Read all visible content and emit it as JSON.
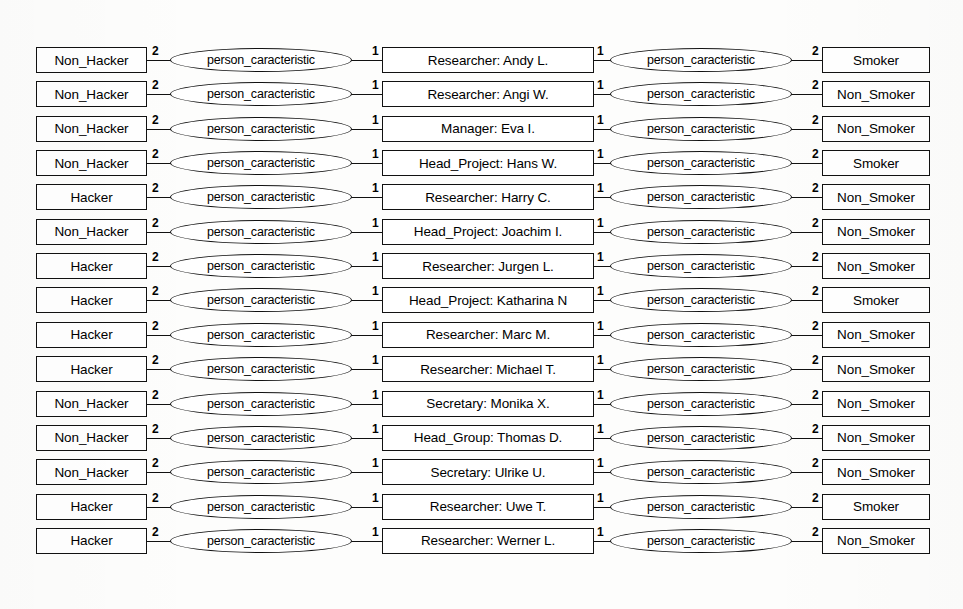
{
  "diagram": {
    "relationship_label": "person_caracteristic",
    "cardinality_left_outer": "2",
    "cardinality_left_inner": "1",
    "cardinality_right_inner": "1",
    "cardinality_right_outer": "2",
    "colors": {
      "stroke": "#111111",
      "background": "#fdfdfc",
      "text": "#000000"
    },
    "columns": {
      "left": "hacker_status",
      "center": "person",
      "right": "smoker_status"
    },
    "rows": [
      {
        "left": "Non_Hacker",
        "rel_left": "person_caracteristic",
        "center": "Researcher: Andy L.",
        "rel_right": "person_caracteristic",
        "right": "Smoker",
        "c1": "2",
        "c2": "1",
        "c3": "1",
        "c4": "2"
      },
      {
        "left": "Non_Hacker",
        "rel_left": "person_caracteristic",
        "center": "Researcher: Angi W.",
        "rel_right": "person_caracteristic",
        "right": "Non_Smoker",
        "c1": "2",
        "c2": "1",
        "c3": "1",
        "c4": "2"
      },
      {
        "left": "Non_Hacker",
        "rel_left": "person_caracteristic",
        "center": "Manager: Eva I.",
        "rel_right": "person_caracteristic",
        "right": "Non_Smoker",
        "c1": "2",
        "c2": "1",
        "c3": "1",
        "c4": "2"
      },
      {
        "left": "Non_Hacker",
        "rel_left": "person_caracteristic",
        "center": "Head_Project: Hans W.",
        "rel_right": "person_caracteristic",
        "right": "Smoker",
        "c1": "2",
        "c2": "1",
        "c3": "1",
        "c4": "2"
      },
      {
        "left": "Hacker",
        "rel_left": "person_caracteristic",
        "center": "Researcher: Harry C.",
        "rel_right": "person_caracteristic",
        "right": "Non_Smoker",
        "c1": "2",
        "c2": "1",
        "c3": "1",
        "c4": "2"
      },
      {
        "left": "Non_Hacker",
        "rel_left": "person_caracteristic",
        "center": "Head_Project: Joachim I.",
        "rel_right": "person_caracteristic",
        "right": "Non_Smoker",
        "c1": "2",
        "c2": "1",
        "c3": "1",
        "c4": "2"
      },
      {
        "left": "Hacker",
        "rel_left": "person_caracteristic",
        "center": "Researcher: Jurgen L.",
        "rel_right": "person_caracteristic",
        "right": "Non_Smoker",
        "c1": "2",
        "c2": "1",
        "c3": "1",
        "c4": "2"
      },
      {
        "left": "Hacker",
        "rel_left": "person_caracteristic",
        "center": "Head_Project: Katharina N",
        "rel_right": "person_caracteristic",
        "right": "Smoker",
        "c1": "2",
        "c2": "1",
        "c3": "1",
        "c4": "2"
      },
      {
        "left": "Hacker",
        "rel_left": "person_caracteristic",
        "center": "Researcher: Marc M.",
        "rel_right": "person_caracteristic",
        "right": "Non_Smoker",
        "c1": "2",
        "c2": "1",
        "c3": "1",
        "c4": "2"
      },
      {
        "left": "Hacker",
        "rel_left": "person_caracteristic",
        "center": "Researcher: Michael T.",
        "rel_right": "person_caracteristic",
        "right": "Non_Smoker",
        "c1": "2",
        "c2": "1",
        "c3": "1",
        "c4": "2"
      },
      {
        "left": "Non_Hacker",
        "rel_left": "person_caracteristic",
        "center": "Secretary: Monika X.",
        "rel_right": "person_caracteristic",
        "right": "Non_Smoker",
        "c1": "2",
        "c2": "1",
        "c3": "1",
        "c4": "2"
      },
      {
        "left": "Non_Hacker",
        "rel_left": "person_caracteristic",
        "center": "Head_Group: Thomas D.",
        "rel_right": "person_caracteristic",
        "right": "Non_Smoker",
        "c1": "2",
        "c2": "1",
        "c3": "1",
        "c4": "2"
      },
      {
        "left": "Non_Hacker",
        "rel_left": "person_caracteristic",
        "center": "Secretary: Ulrike U.",
        "rel_right": "person_caracteristic",
        "right": "Non_Smoker",
        "c1": "2",
        "c2": "1",
        "c3": "1",
        "c4": "2"
      },
      {
        "left": "Hacker",
        "rel_left": "person_caracteristic",
        "center": "Researcher: Uwe T.",
        "rel_right": "person_caracteristic",
        "right": "Smoker",
        "c1": "2",
        "c2": "1",
        "c3": "1",
        "c4": "2"
      },
      {
        "left": "Hacker",
        "rel_left": "person_caracteristic",
        "center": "Researcher: Werner L.",
        "rel_right": "person_caracteristic",
        "right": "Non_Smoker",
        "c1": "2",
        "c2": "1",
        "c3": "1",
        "c4": "2"
      }
    ]
  }
}
